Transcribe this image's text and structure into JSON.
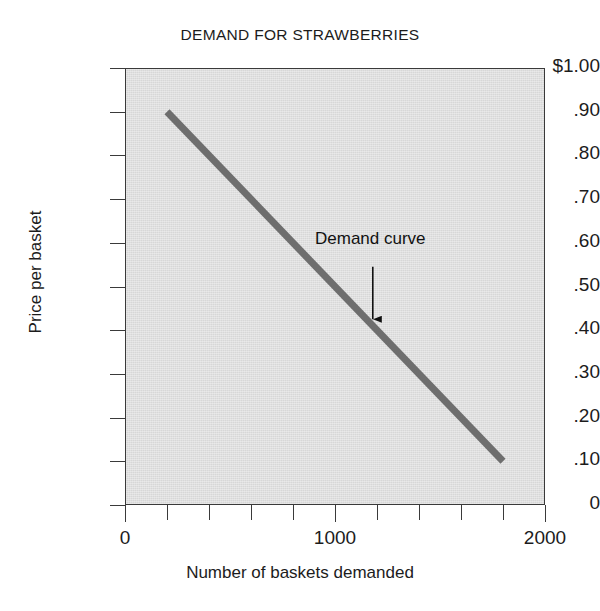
{
  "chart_data": {
    "type": "line",
    "title": "DEMAND FOR STRAWBERRIES",
    "xlabel": "Number of baskets demanded",
    "ylabel": "Price per basket",
    "xlim": [
      0,
      2000
    ],
    "ylim": [
      0,
      1.0
    ],
    "grid": false,
    "legend": "none",
    "x_tick_labels": [
      "0",
      "1000",
      "2000"
    ],
    "x_tick_values": [
      0,
      1000,
      2000
    ],
    "x_minor_tick_values": [
      0,
      200,
      400,
      600,
      800,
      1000,
      1200,
      1400,
      1600,
      1800,
      2000
    ],
    "y_tick_labels": [
      "$1.00",
      ".90",
      ".80",
      ".70",
      ".60",
      ".50",
      ".40",
      ".30",
      ".20",
      ".10",
      "0"
    ],
    "y_tick_values": [
      1.0,
      0.9,
      0.8,
      0.7,
      0.6,
      0.5,
      0.4,
      0.3,
      0.2,
      0.1,
      0
    ],
    "series": [
      {
        "name": "Demand curve",
        "color": "#6e6e6e",
        "linewidth_px": 7,
        "x": [
          200,
          1800
        ],
        "y": [
          0.9,
          0.1
        ],
        "points": [
          {
            "x": 200,
            "y": 0.9
          },
          {
            "x": 400,
            "y": 0.8
          },
          {
            "x": 600,
            "y": 0.7
          },
          {
            "x": 800,
            "y": 0.6
          },
          {
            "x": 1000,
            "y": 0.5
          },
          {
            "x": 1200,
            "y": 0.4
          },
          {
            "x": 1400,
            "y": 0.3
          },
          {
            "x": 1600,
            "y": 0.2
          },
          {
            "x": 1800,
            "y": 0.1
          }
        ]
      }
    ],
    "annotations": [
      {
        "text": "Demand curve",
        "arrow_from": {
          "x": 1180,
          "y": 0.545
        },
        "arrow_to": {
          "x": 1180,
          "y": 0.425
        }
      }
    ]
  },
  "colors": {
    "plot_background": "#d7d7d7",
    "page_background": "#ffffff",
    "axis": "#3a3a3a",
    "curve": "#6e6e6e",
    "text": "#1c1c1c"
  }
}
